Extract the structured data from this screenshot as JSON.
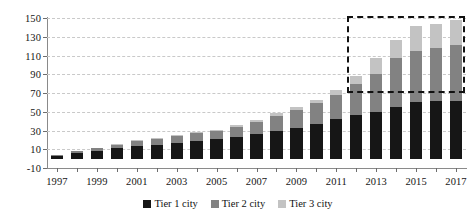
{
  "chart_data": {
    "type": "bar",
    "stacked": true,
    "title": "",
    "subtitle": "",
    "xlabel": "",
    "ylabel": "",
    "grid": true,
    "legend_position": "bottom",
    "ylim": [
      -10,
      150
    ],
    "ytick_step": 20,
    "ytick_labels": [
      "150",
      "130",
      "110",
      "90",
      "70",
      "50",
      "30",
      "10",
      "-10"
    ],
    "ytick_values": [
      150,
      130,
      110,
      90,
      70,
      50,
      30,
      10,
      -10
    ],
    "categories": [
      1997,
      1998,
      1999,
      2000,
      2001,
      2002,
      2003,
      2004,
      2005,
      2006,
      2007,
      2008,
      2009,
      2010,
      2011,
      2012,
      2013,
      2014,
      2015,
      2016,
      2017
    ],
    "xtick_labels": [
      "1997",
      "1999",
      "2001",
      "2003",
      "2005",
      "2007",
      "2009",
      "2011",
      "2013",
      "2015",
      "2017"
    ],
    "xtick_categories": [
      1997,
      1999,
      2001,
      2003,
      2005,
      2007,
      2009,
      2011,
      2013,
      2015,
      2017
    ],
    "series": [
      {
        "name": "Tier 1 city",
        "color": "#161616",
        "values": [
          3,
          6,
          8,
          11,
          14,
          15,
          17,
          19,
          21,
          23,
          26,
          30,
          33,
          37,
          42,
          47,
          50,
          55,
          60,
          61,
          62
        ]
      },
      {
        "name": "Tier 2 city",
        "color": "#828282",
        "values": [
          1,
          2,
          3,
          4,
          5,
          6,
          7,
          8,
          9,
          11,
          13,
          16,
          19,
          22,
          26,
          33,
          40,
          52,
          55,
          57,
          59
        ]
      },
      {
        "name": "Tier 3 city",
        "color": "#c3c3c3",
        "values": [
          0,
          0,
          0,
          1,
          1,
          1,
          1,
          1,
          1,
          2,
          2,
          3,
          3,
          4,
          5,
          8,
          17,
          20,
          26,
          26,
          27
        ]
      }
    ],
    "totals": [
      4,
      8,
      11,
      16,
      20,
      22,
      25,
      28,
      31,
      36,
      41,
      49,
      55,
      63,
      73,
      88,
      107,
      127,
      141,
      144,
      148
    ],
    "annotations": [
      {
        "name": "highlight-box",
        "type": "dashed-rectangle",
        "color": "#111111",
        "x_start_category": 2012,
        "x_end_category": 2017,
        "y_bottom": 70,
        "y_top": 152
      }
    ]
  },
  "legend": {
    "items": [
      {
        "label": "Tier 1 city",
        "color": "#161616"
      },
      {
        "label": "Tier 2 city",
        "color": "#828282"
      },
      {
        "label": "Tier 3 city",
        "color": "#c3c3c3"
      }
    ]
  }
}
